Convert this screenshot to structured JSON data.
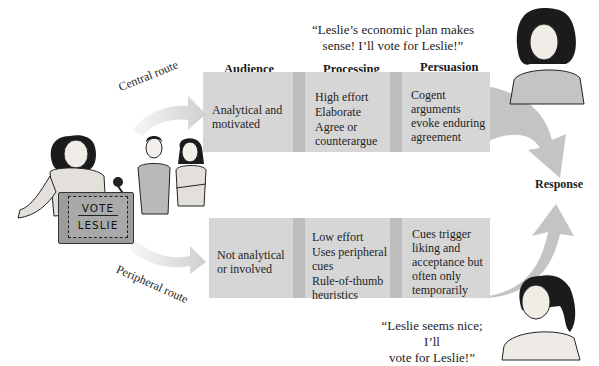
{
  "quotes": {
    "central": "“Leslie’s economic plan makes sense! I’ll vote for Leslie!”",
    "central_line1": "“Leslie’s economic plan makes",
    "central_line2": "sense! I’ll vote for Leslie!”",
    "peripheral_line1": "“Leslie seems nice; I’ll",
    "peripheral_line2": "vote for Leslie!”"
  },
  "columns": {
    "audience": "Audience",
    "processing": "Processing",
    "persuasion": "Persuasion"
  },
  "routes": {
    "central": {
      "label": "Central route",
      "audience": [
        "Analytical and",
        "motivated"
      ],
      "processing": [
        "High effort",
        "Elaborate",
        "Agree or",
        "counterargue"
      ],
      "persuasion": [
        "Cogent",
        "arguments",
        "evoke enduring",
        "agreement"
      ]
    },
    "peripheral": {
      "label": "Peripheral route",
      "audience": [
        "Not analytical",
        "or involved"
      ],
      "processing": [
        "Low effort",
        "Uses peripheral",
        "cues",
        "Rule-of-thumb",
        "heuristics"
      ],
      "persuasion": [
        "Cues trigger",
        "liking and",
        "acceptance but",
        "often only",
        "temporarily"
      ]
    }
  },
  "response_label": "Response",
  "podium_sign": {
    "line1": "VOTE",
    "line2": "LESLIE"
  },
  "colors": {
    "box": "#d6d6d6",
    "separator": "#bdbdbd",
    "arrow": "#c4c4c4",
    "route_arrow_light": "#ebebeb"
  }
}
